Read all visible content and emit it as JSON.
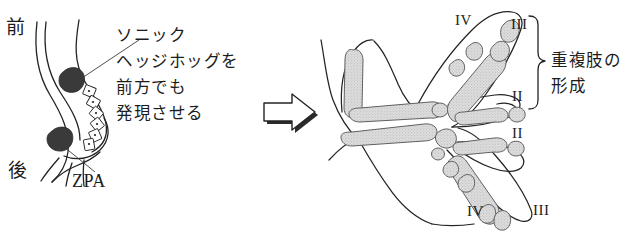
{
  "figure": {
    "colors": {
      "ink": "#1c1c1c",
      "outline": "#2a2a2a",
      "cartilage_fill": "#d9d9d9",
      "cartilage_stroke": "#555555",
      "zpa_fill": "#3a3a3a",
      "background": "#ffffff"
    }
  },
  "left_panel": {
    "anterior_label": "前",
    "posterior_label": "後",
    "zpa_label": "ZPA",
    "annotation_lines": [
      "ソニック",
      "ヘッジホッグを",
      "前方でも",
      "発現させる"
    ],
    "annotation_text": "ソニックヘッジホッグを前方でも発現させる"
  },
  "arrow": {
    "name": "block-arrow-right",
    "direction": "right"
  },
  "right_panel": {
    "caption_lines": [
      "重複肢の",
      "形成"
    ],
    "caption_text": "重複肢の形成",
    "digit_labels": [
      {
        "id": "top-outer",
        "text": "IV"
      },
      {
        "id": "top-inner",
        "text": "III"
      },
      {
        "id": "mid-upper",
        "text": "II"
      },
      {
        "id": "mid-lower",
        "text": "II"
      },
      {
        "id": "bottom-outer",
        "text": "IV"
      },
      {
        "id": "bottom-inner",
        "text": "III"
      }
    ],
    "brace": {
      "name": "curly-brace",
      "spans": [
        "III",
        "II"
      ]
    }
  }
}
